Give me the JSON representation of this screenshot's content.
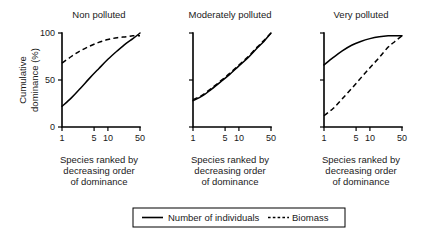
{
  "figure": {
    "y_axis_title_line1": "Cumulative",
    "y_axis_title_line2": "dominance (%)",
    "x_caption_line1": "Species ranked by",
    "x_caption_line2": "decreasing order",
    "x_caption_line3": "of dominance"
  },
  "legend": {
    "position": "bottom",
    "entries": [
      {
        "label": "Number of individuals",
        "style": "solid",
        "icon": "solid-line-icon"
      },
      {
        "label": "Biomass",
        "style": "dashed",
        "icon": "dashed-line-icon"
      }
    ]
  },
  "chart_data": {
    "type": "line",
    "title": "",
    "xlabel": "Species ranked by decreasing order of dominance",
    "ylabel": "Cumulative dominance (%)",
    "xscale": "log",
    "xlim": [
      1,
      50
    ],
    "ylim": [
      0,
      100
    ],
    "xticks": [
      1,
      5,
      10,
      50
    ],
    "xtick_labels": [
      "1",
      "5",
      "10",
      "50"
    ],
    "yticks": [
      0,
      50,
      100
    ],
    "ytick_labels": [
      "0",
      "50",
      "100"
    ],
    "grid": false,
    "panels": [
      {
        "title": "Non polluted",
        "series": [
          {
            "name": "Number of individuals",
            "style": "solid",
            "x": [
              1,
              1.6,
              2.5,
              4,
              6.3,
              10,
              16,
              25,
              35,
              50
            ],
            "values": [
              22,
              31,
              41,
              52,
              62,
              72,
              81,
              89,
              94,
              100
            ]
          },
          {
            "name": "Biomass",
            "style": "dashed",
            "x": [
              1,
              1.6,
              2.5,
              4,
              6.3,
              10,
              16,
              25,
              35,
              50
            ],
            "values": [
              68,
              75,
              81,
              86,
              90,
              93,
              95,
              96,
              97,
              97
            ]
          }
        ]
      },
      {
        "title": "Moderately polluted",
        "series": [
          {
            "name": "Number of individuals",
            "style": "solid",
            "x": [
              1,
              1.6,
              2.5,
              4,
              6.3,
              10,
              16,
              25,
              35,
              50
            ],
            "values": [
              28,
              33,
              40,
              48,
              56,
              65,
              74,
              84,
              91,
              100
            ]
          },
          {
            "name": "Biomass",
            "style": "dashed",
            "x": [
              1,
              1.6,
              2.5,
              4,
              6.3,
              10,
              16,
              25,
              35,
              50
            ],
            "values": [
              29,
              34,
              41,
              49,
              57,
              66,
              75,
              85,
              92,
              100
            ]
          }
        ]
      },
      {
        "title": "Very polluted",
        "series": [
          {
            "name": "Number of individuals",
            "style": "solid",
            "x": [
              1,
              1.6,
              2.5,
              4,
              6.3,
              10,
              16,
              25,
              35,
              50
            ],
            "values": [
              66,
              74,
              81,
              87,
              91,
              94,
              96,
              97,
              97,
              97
            ]
          },
          {
            "name": "Biomass",
            "style": "dashed",
            "x": [
              1,
              1.6,
              2.5,
              4,
              6.3,
              10,
              16,
              25,
              35,
              50
            ],
            "values": [
              12,
              20,
              30,
              41,
              52,
              63,
              74,
              85,
              91,
              97
            ]
          }
        ]
      }
    ]
  }
}
